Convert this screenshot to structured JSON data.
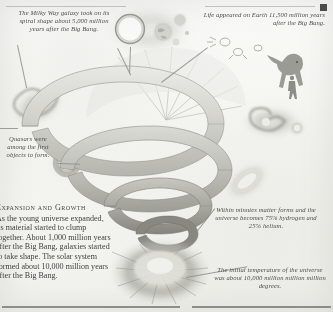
{
  "page": {
    "background_color": "#fbfbf9",
    "ink_color": "#4a4a48",
    "title_mark": "square-mark"
  },
  "captions": [
    {
      "name": "milky-way-caption",
      "text": "The Milky Way galaxy took on its spiral shape about 5,000 million years after the Big Bang.",
      "align": "center"
    },
    {
      "name": "life-on-earth-caption",
      "text": "Life appeared on Earth 11,500 million years after the Big Bang.",
      "align": "right"
    },
    {
      "name": "quasars-caption",
      "text": "Quasars were among the first objects to form.",
      "align": "center"
    },
    {
      "name": "matter-forms-caption",
      "text": "Within minutes matter forms and the universe becomes 75% hydrogen and 25% helium.",
      "align": "center"
    },
    {
      "name": "initial-temperature-caption",
      "text": "The initial temperature of the universe was about 10,000 million million million degrees.",
      "align": "center"
    }
  ],
  "article": {
    "name": "expansion-and-growth-block",
    "heading": "Expansion and Growth",
    "body": "As the young universe expanded, its material started to clump together. About 1,000 million years after the Big Bang, galaxies started to take shape. The solar system formed about 10,000 million years after the Big Bang."
  },
  "illustrations": [
    {
      "name": "spiral-funnel-illustration",
      "label": "expanding universe spiral"
    },
    {
      "name": "big-bang-burst-illustration",
      "label": "big bang explosion burst"
    },
    {
      "name": "solar-system-illustration",
      "label": "sun and planets"
    },
    {
      "name": "spiral-galaxy-left-illustration",
      "label": "spiral galaxy"
    },
    {
      "name": "spiral-galaxy-right-illustration",
      "label": "spiral galaxy with companion"
    },
    {
      "name": "elliptical-galaxy-illustration",
      "label": "elliptical galaxy"
    },
    {
      "name": "quasar-illustration",
      "label": "quasar ring"
    },
    {
      "name": "dinosaur-illustration",
      "label": "dinosaur"
    },
    {
      "name": "human-figure-illustration",
      "label": "human figure"
    },
    {
      "name": "microbe-illustration",
      "label": "early life microbes"
    }
  ]
}
